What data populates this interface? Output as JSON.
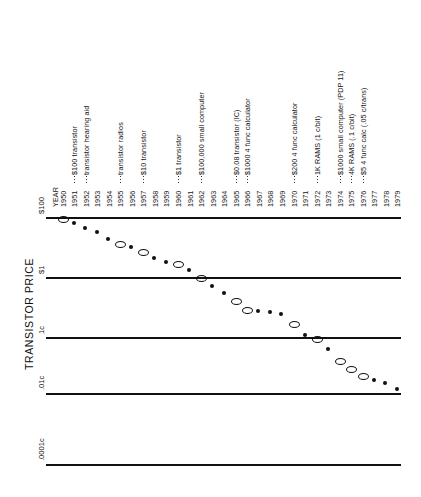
{
  "figure": {
    "axis_title": "TRANSISTOR PRICE",
    "year_axis_title": "YEAR"
  },
  "chart_data": {
    "type": "scatter",
    "title": "",
    "xlabel": "YEAR",
    "ylabel": "TRANSISTOR PRICE",
    "grid": true,
    "legend_position": "none",
    "y_scale": "log",
    "y_tick_labels": [
      "$100",
      "$1",
      "1c",
      ".01c",
      ".0001c"
    ],
    "y_tick_values": [
      100,
      1,
      0.01,
      0.0001,
      1e-06
    ],
    "x_tick_labels": [
      "1950",
      "1951",
      "1952",
      "1953",
      "1954",
      "1955",
      "1956",
      "1957",
      "1958",
      "1959",
      "1960",
      "1961",
      "1962",
      "1963",
      "1964",
      "1965",
      "1966",
      "1967",
      "1968",
      "1969",
      "1970",
      "1971",
      "1972",
      "1973",
      "1974",
      "1975",
      "1976",
      "1977",
      "1978",
      "1979"
    ],
    "categories": [
      "1950",
      "1951",
      "1952",
      "1953",
      "1954",
      "1955",
      "1956",
      "1957",
      "1958",
      "1959",
      "1960",
      "1961",
      "1962",
      "1963",
      "1964",
      "1965",
      "1966",
      "1967",
      "1968",
      "1969",
      "1970",
      "1971",
      "1972",
      "1973",
      "1974",
      "1975",
      "1976",
      "1977",
      "1978",
      "1979"
    ],
    "values": [
      100,
      70,
      45,
      33,
      20,
      14,
      11,
      7.5,
      4.5,
      3.2,
      3.0,
      1.8,
      1.0,
      0.52,
      0.3,
      0.17,
      0.085,
      0.08,
      0.074,
      0.06,
      0.03,
      0.013,
      0.01,
      0.004,
      0.0016,
      0.0008,
      0.00045,
      0.0003,
      0.00024,
      0.00015
    ],
    "marker_styles": [
      "hollow",
      "filled",
      "filled",
      "filled",
      "filled",
      "hollow",
      "filled",
      "hollow",
      "filled",
      "filled",
      "hollow",
      "filled",
      "hollow",
      "filled",
      "filled",
      "hollow",
      "hollow",
      "filled",
      "filled",
      "filled",
      "hollow",
      "filled",
      "hollow",
      "filled",
      "hollow",
      "hollow",
      "hollow",
      "filled",
      "filled",
      "filled"
    ],
    "annotations": [
      {
        "year": "1951",
        "text": "$100 transistor"
      },
      {
        "year": "1952",
        "text": "transistor hearing aid"
      },
      {
        "year": "1955",
        "text": "transistor radios"
      },
      {
        "year": "1957",
        "text": "$10 transistor"
      },
      {
        "year": "1960",
        "text": "$1 transistor"
      },
      {
        "year": "1962",
        "text": "$100,000 small computer"
      },
      {
        "year": "1965",
        "text": "$0.08 transistor (IC)"
      },
      {
        "year": "1966",
        "text": "$1000 4 func calculator"
      },
      {
        "year": "1970",
        "text": "$200 4 func calculator"
      },
      {
        "year": "1972",
        "text": "1K RAMS (1 c/bit)"
      },
      {
        "year": "1974",
        "text": "$1000 small computer (PDP 11)"
      },
      {
        "year": "1975",
        "text": "4K RAMS (.1 c/bit)"
      },
      {
        "year": "1976",
        "text": "$5 4 func calc (.05 c/trans)"
      }
    ]
  }
}
